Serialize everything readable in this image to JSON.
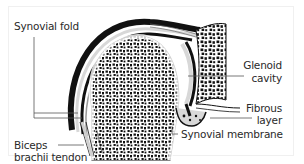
{
  "diagram": {
    "labels": {
      "synovial_fold": "Synovial fold",
      "glenoid_line1": "Glenoid",
      "glenoid_line2": "cavity",
      "fibrous_line1": "Fibrous",
      "fibrous_line2": "layer",
      "synovial_membrane": "Synovial membrane",
      "biceps_line1": "Biceps",
      "biceps_line2": "brachii tendon"
    },
    "structures": [
      "humeral-head",
      "glenoid-scapula",
      "joint-capsule",
      "synovial-fold",
      "synovial-membrane",
      "fibrous-layer",
      "biceps-brachii-tendon"
    ],
    "colors": {
      "ink": "#1a1a1a",
      "capsule_gray": "#9a9a9a",
      "light_gray": "#d8d8d8",
      "background": "#ffffff"
    }
  }
}
